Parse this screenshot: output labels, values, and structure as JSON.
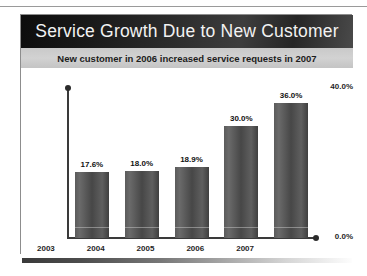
{
  "slide": {
    "title": "Service Growth Due to New Customer",
    "subtitle": "New customer in 2006 increased service requests in 2007"
  },
  "colors": {
    "title_band_dark": "#0d0d0d",
    "subtitle_band": "#c9c9c9",
    "bar_fill": "#4f4f4f",
    "axis": "#3a3a3a",
    "title_text": "#f2f2f2",
    "subtitle_text": "#1c1c1c"
  },
  "chart_data": {
    "type": "bar",
    "title": "Service Growth Due to New Customer",
    "subtitle": "New customer in 2006 increased service requests in 2007",
    "categories": [
      "2003",
      "2004",
      "2005",
      "2006",
      "2007"
    ],
    "values": [
      17.6,
      18.0,
      18.9,
      30.0,
      36.0
    ],
    "data_labels": [
      "17.6%",
      "18.0%",
      "18.9%",
      "30.0%",
      "36.0%"
    ],
    "xlabel": "",
    "ylabel": "",
    "ylim": [
      0,
      40
    ],
    "ytick_labels": [
      "0.0%",
      "40.0%"
    ],
    "ytick_values": [
      0,
      40
    ],
    "grid": false,
    "legend": false
  }
}
